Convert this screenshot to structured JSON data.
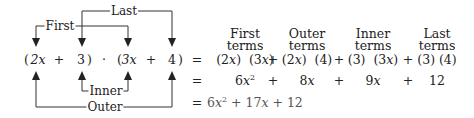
{
  "diagram": {
    "factored_expression": {
      "open1": "(",
      "a": "2x",
      "plus1": "+",
      "b": "3",
      "close1": ")",
      "dot": "·",
      "open2": "(",
      "c": "3x",
      "plus2": "+",
      "d": "4",
      "close2": ")"
    },
    "connector_labels": {
      "first": "First",
      "last": "Last",
      "inner": "Inner",
      "outer": "Outer"
    },
    "column_headers": [
      {
        "line1": "First",
        "line2": "terms"
      },
      {
        "line1": "Outer",
        "line2": "terms"
      },
      {
        "line1": "Inner",
        "line2": "terms"
      },
      {
        "line1": "Last",
        "line2": "terms"
      }
    ],
    "equals": "=",
    "plus": "+",
    "row_products": [
      "(2x)  (3x)",
      "(2x)  (4)",
      "(3)  (3x)",
      "(3) (4)"
    ],
    "row_results": {
      "first_coef": "6x",
      "first_exp": "2",
      "outer": "8x",
      "inner": "9x",
      "last": "12"
    },
    "final": {
      "prefix": "6x",
      "exp": "2",
      "rest": " + 17x + 12"
    }
  }
}
